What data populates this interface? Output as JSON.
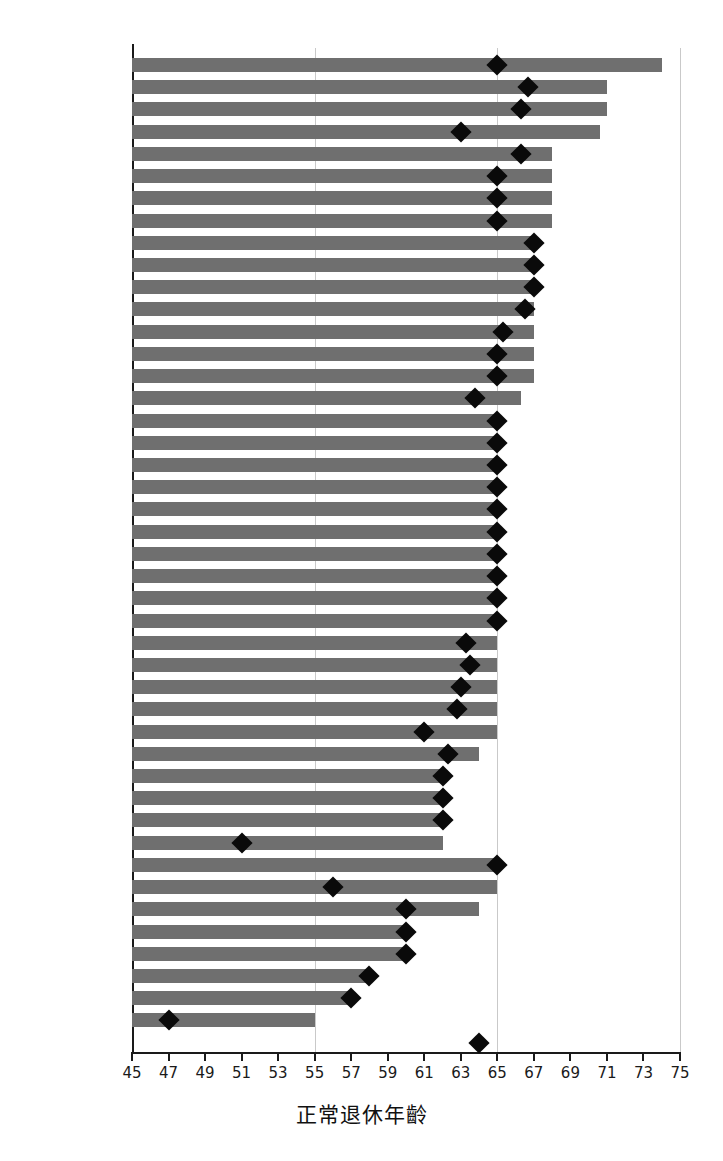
{
  "chart_data": {
    "type": "bar",
    "title": "",
    "xlabel": "正常退休年齡",
    "ylabel": "",
    "xlim": [
      45,
      75
    ],
    "xticks": [
      45,
      47,
      49,
      51,
      53,
      55,
      57,
      59,
      61,
      63,
      65,
      67,
      69,
      71,
      73,
      75
    ],
    "gridlines": [
      55,
      65,
      75
    ],
    "grid": true,
    "legend": "none",
    "orientation": "horizontal",
    "bar_color": "#6f6f6f",
    "marker_color": "#0a0a0a",
    "marker_shape": "diamond",
    "axis_color": "#1a1a1a",
    "grid_color": "#c9c9c9",
    "categories": [
      "丹麥",
      "義大利",
      "荷蘭",
      "愛沙尼亞",
      "愛爾蘭",
      "英國",
      "芬蘭",
      "葡萄牙",
      "冰島",
      "以色列",
      "挪威",
      "美國",
      "德國",
      "澳洲",
      "比利時",
      "法國",
      "奧地利",
      "加拿大",
      "智利",
      "日本",
      "墨西哥",
      "紐西蘭",
      "波蘭",
      "西班牙",
      "瑞典",
      "瑞士",
      "立陶宛",
      "匈牙利",
      "捷克",
      "拉脫維亞",
      "南韓",
      "斯洛伐克",
      "希臘",
      "盧森堡",
      "斯洛維尼亞",
      "土耳其",
      "阿根廷",
      "印尼",
      "俄羅斯",
      "中國",
      "南非",
      "印度",
      "巴西",
      "沙烏地阿拉伯",
      "歐盟28國"
    ],
    "series": [
      {
        "name": "未來正常退休年齡",
        "values": [
          74.0,
          71.0,
          71.0,
          70.6,
          68.0,
          68.0,
          68.0,
          68.0,
          67.0,
          67.0,
          67.0,
          67.0,
          67.0,
          67.0,
          67.0,
          66.3,
          65.0,
          65.0,
          65.0,
          65.0,
          65.0,
          65.0,
          65.0,
          65.0,
          65.0,
          65.0,
          65.0,
          65.0,
          65.0,
          65.0,
          65.0,
          64.0,
          62.0,
          62.0,
          62.0,
          62.0,
          65.0,
          65.0,
          64.0,
          60.0,
          60.0,
          58.0,
          57.0,
          55.0,
          null
        ]
      },
      {
        "name": "目前正常退休年齡",
        "values": [
          65.0,
          66.7,
          66.3,
          63.0,
          66.3,
          65.0,
          65.0,
          65.0,
          67.0,
          67.0,
          67.0,
          66.5,
          65.3,
          65.0,
          65.0,
          63.8,
          65.0,
          65.0,
          65.0,
          65.0,
          65.0,
          65.0,
          65.0,
          65.0,
          65.0,
          65.0,
          63.3,
          63.5,
          63.0,
          62.8,
          61.0,
          62.3,
          62.0,
          62.0,
          62.0,
          51.0,
          65.0,
          56.0,
          60.0,
          60.0,
          60.0,
          58.0,
          57.0,
          47.0,
          64.0
        ]
      }
    ]
  }
}
